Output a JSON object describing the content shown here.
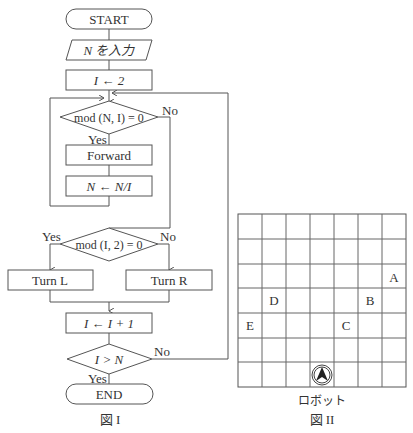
{
  "figure1": {
    "caption": "図 I",
    "nodes": {
      "start": "START",
      "input": "N を入力",
      "init": "I ← 2",
      "cond_mod_n": "mod (N, I) = 0",
      "forward": "Forward",
      "divide": "N ← N/I",
      "cond_mod_2": "mod (I, 2) = 0",
      "turn_l": "Turn L",
      "turn_r": "Turn R",
      "increment": "I ← I + 1",
      "cond_gt": "I > N",
      "end": "END"
    },
    "labels": {
      "yes": "Yes",
      "no": "No"
    }
  },
  "figure2": {
    "caption": "図 II",
    "robot_label": "ロボット",
    "grid": {
      "cols": 7,
      "rows": 7
    },
    "markers": [
      {
        "label": "A",
        "col": 6,
        "row": 2
      },
      {
        "label": "B",
        "col": 5,
        "row": 3
      },
      {
        "label": "C",
        "col": 4,
        "row": 4
      },
      {
        "label": "D",
        "col": 1,
        "row": 3
      },
      {
        "label": "E",
        "col": 0,
        "row": 4
      }
    ],
    "robot": {
      "col": 3,
      "row": 6,
      "facing": "up"
    }
  }
}
